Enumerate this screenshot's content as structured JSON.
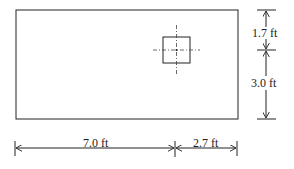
{
  "diagram": {
    "type": "plan view of rectangular footing with square column",
    "colors": {
      "line": "#222222",
      "background": "#ffffff"
    },
    "dimensions": {
      "top_offset": "1.7 ft",
      "bottom_offset": "3.0 ft",
      "left_length": "7.0 ft",
      "right_length": "2.7 ft"
    }
  }
}
